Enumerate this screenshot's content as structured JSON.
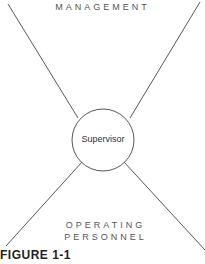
{
  "diagram": {
    "top_label": "MANAGEMENT",
    "bottom_label_line1": "OPERATING",
    "bottom_label_line2": "PERSONNEL",
    "center_label": "Supervisor",
    "caption": "FIGURE 1-1"
  }
}
